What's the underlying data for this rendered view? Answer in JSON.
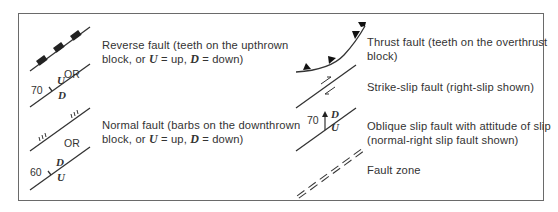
{
  "legend": {
    "entries": [
      {
        "id": "reverse-fault",
        "description_line1": "Reverse fault (teeth on the upthrown",
        "description_line2_pre": "block, or ",
        "description_line2_u": "U",
        "description_line2_mid": " = up, ",
        "description_line2_d": "D",
        "description_line2_post": " = down)",
        "symbol": {
          "or_label": "OR",
          "dip": "70",
          "upper_label": "U",
          "lower_label": "D"
        }
      },
      {
        "id": "normal-fault",
        "description_line1": "Normal fault (barbs on the downthrown",
        "description_line2_pre": "block, or ",
        "description_line2_u": "U",
        "description_line2_mid": " = up, ",
        "description_line2_d": "D",
        "description_line2_post": " = down)",
        "symbol": {
          "or_label": "OR",
          "dip": "60",
          "upper_label": "D",
          "lower_label": "U"
        }
      },
      {
        "id": "thrust-fault",
        "description_line1": "Thrust fault (teeth on the overthrust",
        "description_line2": "block)"
      },
      {
        "id": "strike-slip-fault",
        "description_line1": "Strike-slip fault (right-slip shown)"
      },
      {
        "id": "oblique-slip-fault",
        "description_line1": "Oblique slip fault with attitude of slip",
        "description_line2": "(normal-right slip fault shown)",
        "symbol": {
          "dip": "70",
          "upper_label": "D",
          "lower_label": "U"
        }
      },
      {
        "id": "fault-zone",
        "description_line1": "Fault zone"
      }
    ]
  },
  "colors": {
    "ink": "#333333",
    "frame": "#6a6a6a",
    "background": "#ffffff"
  }
}
